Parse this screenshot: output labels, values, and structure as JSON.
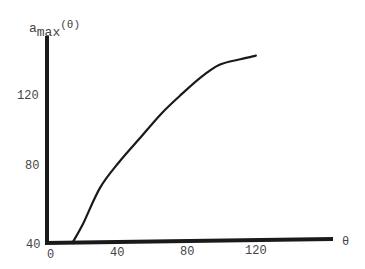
{
  "chart_data": {
    "type": "line",
    "title": "",
    "xlabel": "θ",
    "ylabel": "a_max(θ)",
    "ylabel_parts": {
      "base": "a",
      "sub": "max",
      "arg": "(θ)"
    },
    "x_ticks": [
      "0",
      "40",
      "80",
      "120"
    ],
    "y_ticks": [
      "40",
      "80",
      "120"
    ],
    "xlim": [
      0,
      165
    ],
    "ylim": [
      40,
      150
    ],
    "grid": false,
    "legend": null,
    "series": [
      {
        "name": "a_max(θ)",
        "x": [
          14,
          20,
          30,
          41,
          53,
          65,
          76,
          88,
          99,
          111,
          120
        ],
        "y": [
          40,
          50,
          70,
          84,
          97,
          110,
          120,
          130,
          137,
          140,
          142
        ]
      }
    ]
  }
}
